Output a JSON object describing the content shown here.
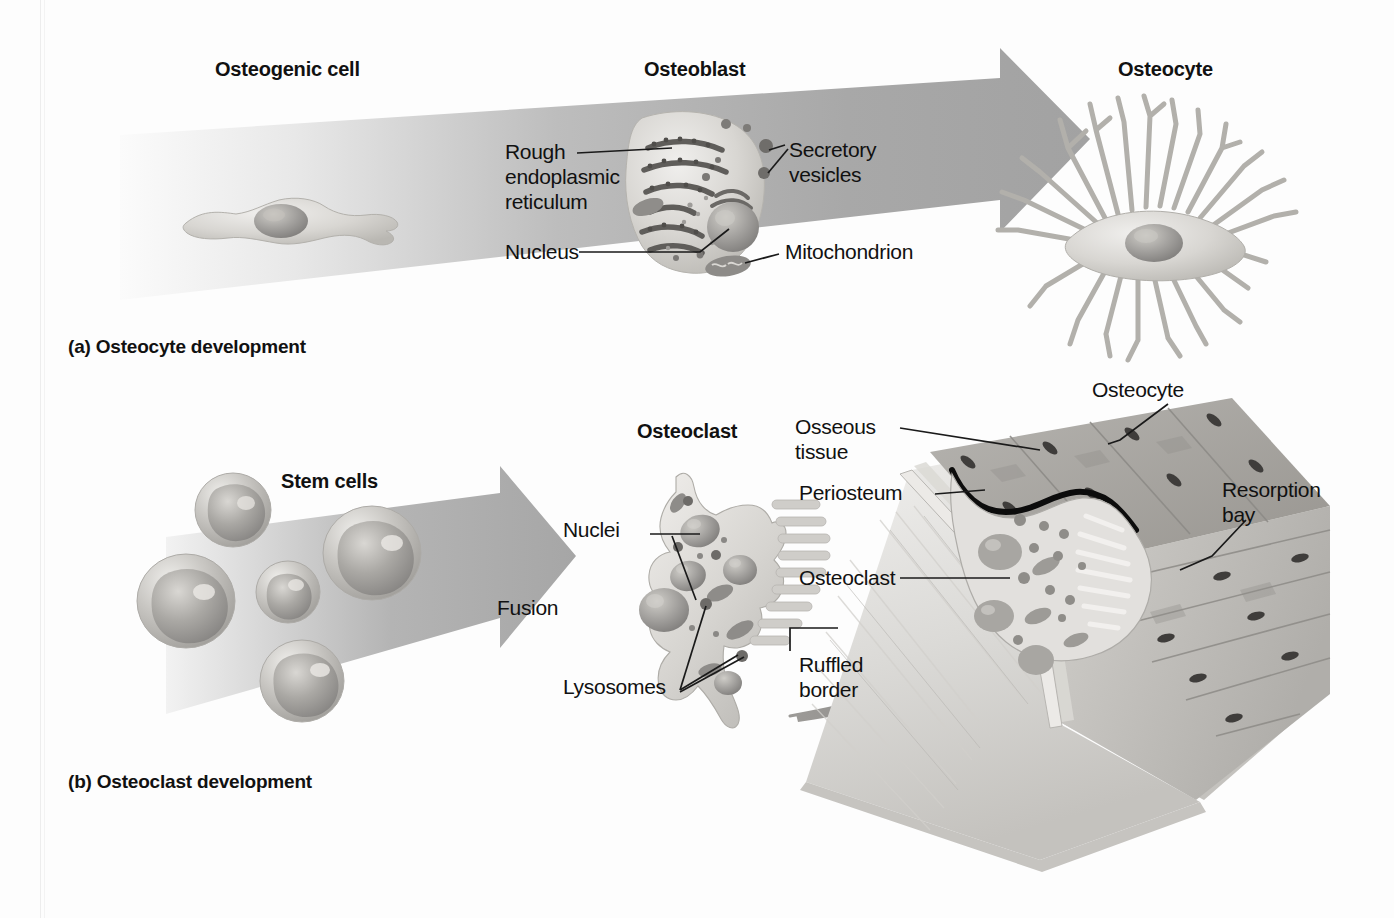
{
  "figure": {
    "title_alt": "Bone cell development",
    "panels": [
      {
        "id": "a",
        "caption": "(a) Osteocyte development",
        "stage_headings": [
          "Osteogenic cell",
          "Osteoblast",
          "Osteocyte"
        ],
        "callouts": [
          "Rough\nendoplasmic\nreticulum",
          "Secretory\nvesicles",
          "Nucleus",
          "Mitochondrion"
        ]
      },
      {
        "id": "b",
        "caption": "(b) Osteoclast development",
        "stage_headings": [
          "Stem cells",
          "Osteoclast"
        ],
        "process_label": "Fusion",
        "callouts": [
          "Nuclei",
          "Lysosomes",
          "Ruffled\nborder",
          "Osseous\ntissue",
          "Periosteum",
          "Osteoclast",
          "Osteocyte",
          "Resorption\nbay"
        ]
      }
    ]
  },
  "panel_a": {
    "heading_osteogenic": "Osteogenic cell",
    "heading_osteoblast": "Osteoblast",
    "heading_osteocyte": "Osteocyte",
    "label_rough_er_l1": "Rough",
    "label_rough_er_l2": "endoplasmic",
    "label_rough_er_l3": "reticulum",
    "label_secretory_l1": "Secretory",
    "label_secretory_l2": "vesicles",
    "label_nucleus": "Nucleus",
    "label_mitochondrion": "Mitochondrion",
    "caption": "(a) Osteocyte development"
  },
  "panel_b": {
    "heading_stem_cells": "Stem cells",
    "heading_osteoclast": "Osteoclast",
    "label_fusion": "Fusion",
    "label_nuclei": "Nuclei",
    "label_lysosomes": "Lysosomes",
    "label_ruffled_l1": "Ruffled",
    "label_ruffled_l2": "border",
    "label_osseous_l1": "Osseous",
    "label_osseous_l2": "tissue",
    "label_periosteum": "Periosteum",
    "label_osteoclast_bone": "Osteoclast",
    "label_osteocyte_bone": "Osteocyte",
    "label_resorption_l1": "Resorption",
    "label_resorption_l2": "bay",
    "caption": "(b) Osteoclast development"
  },
  "colors": {
    "background": "#fdfdfd",
    "arrow_gray": "#a9a9a9",
    "arrow_gray_light": "#d8d8d8",
    "cell_body": "#cfcfcf",
    "cell_body_light": "#e2e2e2",
    "nucleus": "#9a9a9a",
    "organelle_dark": "#6e6e6e",
    "bone_tissue": "#a5a5a5",
    "bone_face": "#dcdcdc",
    "text": "#111111",
    "leader_line": "#1a1a1a"
  }
}
